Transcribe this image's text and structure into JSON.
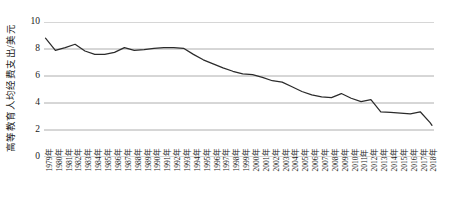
{
  "chart_data": {
    "type": "line",
    "title": "",
    "xlabel": "",
    "ylabel": "高等教育人均经费支出/美元",
    "ylim": [
      0,
      10
    ],
    "yticks": [
      0,
      2,
      4,
      6,
      8,
      10
    ],
    "ytick_labels": [
      "0",
      "2",
      "4",
      "6",
      "8",
      "10"
    ],
    "grid": true,
    "legend": "none",
    "line_color": "#2b2b2b",
    "grid_color": "#9a9a9a",
    "categories": [
      "1979年",
      "1980年",
      "1981年",
      "1982年",
      "1983年",
      "1984年",
      "1985年",
      "1986年",
      "1987年",
      "1988年",
      "1989年",
      "1990年",
      "1991年",
      "1992年",
      "1993年",
      "1994年",
      "1995年",
      "1996年",
      "1997年",
      "1998年",
      "1999年",
      "2000年",
      "2001年",
      "2002年",
      "2003年",
      "2004年",
      "2005年",
      "2006年",
      "2007年",
      "2008年",
      "2009年",
      "2010年",
      "2011年",
      "2012年",
      "2013年",
      "2014年",
      "2015年",
      "2016年",
      "2017年",
      "2018年"
    ],
    "values": [
      8.8,
      7.9,
      8.1,
      8.35,
      7.85,
      7.6,
      7.6,
      7.75,
      8.1,
      7.9,
      7.95,
      8.05,
      8.1,
      8.1,
      8.05,
      7.6,
      7.2,
      6.9,
      6.6,
      6.35,
      6.15,
      6.1,
      5.9,
      5.65,
      5.55,
      5.2,
      4.85,
      4.6,
      4.45,
      4.4,
      4.7,
      4.35,
      4.1,
      4.25,
      3.35,
      3.3,
      3.25,
      3.2,
      3.35,
      2.55
    ],
    "values_tail": 2.35
  }
}
